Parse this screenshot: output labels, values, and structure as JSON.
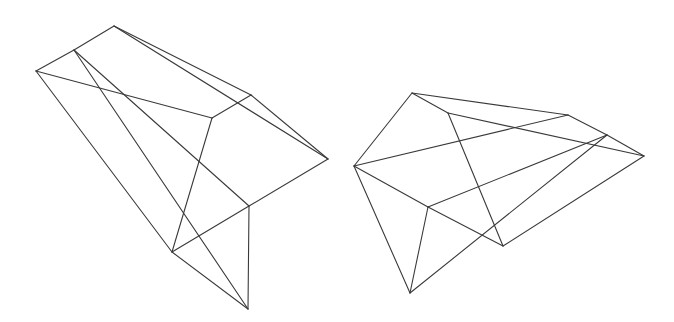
{
  "figure": {
    "background": "#ffffff",
    "stroke_color": "#3a3a3a",
    "shapes": [
      {
        "name": "left-wireframe-polyhedron",
        "vertices": {
          "T": [
            114,
            26
          ],
          "U": [
            74,
            50
          ],
          "L": [
            36,
            71
          ],
          "M": [
            212,
            118
          ],
          "N": [
            251,
            95
          ],
          "R": [
            328,
            159
          ],
          "P": [
            249,
            206
          ],
          "Q": [
            172,
            252
          ],
          "S": [
            248,
            309
          ]
        },
        "edges": [
          [
            "T",
            "U"
          ],
          [
            "U",
            "L"
          ],
          [
            "T",
            "N"
          ],
          [
            "T",
            "R"
          ],
          [
            "N",
            "R"
          ],
          [
            "N",
            "M"
          ],
          [
            "L",
            "M"
          ],
          [
            "L",
            "Q"
          ],
          [
            "M",
            "Q"
          ],
          [
            "U",
            "S"
          ],
          [
            "U",
            "P"
          ],
          [
            "R",
            "P"
          ],
          [
            "P",
            "Q"
          ],
          [
            "Q",
            "S"
          ],
          [
            "P",
            "S"
          ]
        ]
      },
      {
        "name": "right-wireframe-polyhedron",
        "vertices": {
          "A": [
            412,
            93
          ],
          "B": [
            448,
            113
          ],
          "C": [
            568,
            115
          ],
          "D": [
            607,
            135
          ],
          "E": [
            644,
            156
          ],
          "F": [
            354,
            166
          ],
          "G": [
            428,
            207
          ],
          "H": [
            503,
            246
          ],
          "I": [
            410,
            293
          ]
        },
        "edges": [
          [
            "A",
            "F"
          ],
          [
            "A",
            "C"
          ],
          [
            "A",
            "B"
          ],
          [
            "B",
            "E"
          ],
          [
            "B",
            "H"
          ],
          [
            "C",
            "D"
          ],
          [
            "D",
            "E"
          ],
          [
            "F",
            "C"
          ],
          [
            "F",
            "G"
          ],
          [
            "G",
            "H"
          ],
          [
            "F",
            "I"
          ],
          [
            "G",
            "I"
          ],
          [
            "G",
            "D"
          ],
          [
            "I",
            "D"
          ],
          [
            "H",
            "E"
          ]
        ]
      }
    ]
  }
}
